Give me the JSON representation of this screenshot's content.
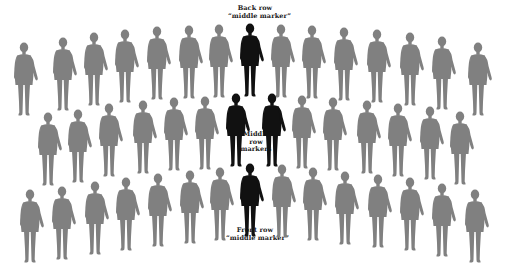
{
  "colors": {
    "background": "#ffffff",
    "regular_figure": "#808080",
    "marker_figure": "#111111",
    "label_text": "#222222"
  },
  "labels": {
    "back_row": {
      "line1": "Back row",
      "line2": "“middle marker”"
    },
    "middle_row": {
      "line1": "Middle",
      "line2": "row",
      "line3": "markers"
    },
    "front_row": {
      "line1": "Front row",
      "line2": "“middle marker”"
    }
  },
  "rows": {
    "back": {
      "name": "Back row",
      "figure_count": 15,
      "marker_count": 1,
      "figures": [
        {
          "x": 12,
          "y": 42,
          "marker": false
        },
        {
          "x": 51,
          "y": 37,
          "marker": false
        },
        {
          "x": 82,
          "y": 32,
          "marker": false
        },
        {
          "x": 113,
          "y": 29,
          "marker": false
        },
        {
          "x": 145,
          "y": 26,
          "marker": false
        },
        {
          "x": 177,
          "y": 25,
          "marker": false
        },
        {
          "x": 207,
          "y": 24,
          "marker": false
        },
        {
          "x": 238,
          "y": 23,
          "marker": true
        },
        {
          "x": 269,
          "y": 24,
          "marker": false
        },
        {
          "x": 300,
          "y": 25,
          "marker": false
        },
        {
          "x": 332,
          "y": 27,
          "marker": false
        },
        {
          "x": 365,
          "y": 29,
          "marker": false
        },
        {
          "x": 398,
          "y": 32,
          "marker": false
        },
        {
          "x": 430,
          "y": 36,
          "marker": false
        },
        {
          "x": 466,
          "y": 42,
          "marker": false
        }
      ]
    },
    "middle": {
      "name": "Middle row",
      "figure_count": 14,
      "marker_count": 2,
      "figures": [
        {
          "x": 36,
          "y": 112,
          "marker": false
        },
        {
          "x": 66,
          "y": 109,
          "marker": false
        },
        {
          "x": 97,
          "y": 103,
          "marker": false
        },
        {
          "x": 131,
          "y": 100,
          "marker": false
        },
        {
          "x": 162,
          "y": 97,
          "marker": false
        },
        {
          "x": 193,
          "y": 96,
          "marker": false
        },
        {
          "x": 224,
          "y": 93,
          "marker": true
        },
        {
          "x": 260,
          "y": 93,
          "marker": true
        },
        {
          "x": 290,
          "y": 95,
          "marker": false
        },
        {
          "x": 321,
          "y": 97,
          "marker": false
        },
        {
          "x": 355,
          "y": 100,
          "marker": false
        },
        {
          "x": 386,
          "y": 103,
          "marker": false
        },
        {
          "x": 418,
          "y": 106,
          "marker": false
        },
        {
          "x": 448,
          "y": 111,
          "marker": false
        }
      ]
    },
    "front": {
      "name": "Front row",
      "figure_count": 15,
      "marker_count": 1,
      "figures": [
        {
          "x": 18,
          "y": 189,
          "marker": false
        },
        {
          "x": 50,
          "y": 186,
          "marker": false
        },
        {
          "x": 83,
          "y": 181,
          "marker": false
        },
        {
          "x": 114,
          "y": 177,
          "marker": false
        },
        {
          "x": 146,
          "y": 173,
          "marker": false
        },
        {
          "x": 178,
          "y": 170,
          "marker": false
        },
        {
          "x": 208,
          "y": 167,
          "marker": false
        },
        {
          "x": 238,
          "y": 163,
          "marker": true
        },
        {
          "x": 270,
          "y": 164,
          "marker": false
        },
        {
          "x": 301,
          "y": 167,
          "marker": false
        },
        {
          "x": 333,
          "y": 171,
          "marker": false
        },
        {
          "x": 366,
          "y": 174,
          "marker": false
        },
        {
          "x": 398,
          "y": 177,
          "marker": false
        },
        {
          "x": 430,
          "y": 183,
          "marker": false
        },
        {
          "x": 463,
          "y": 189,
          "marker": false
        }
      ]
    }
  }
}
